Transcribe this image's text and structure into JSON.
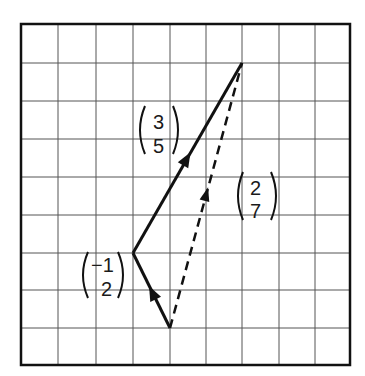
{
  "diagram": {
    "type": "vector-addition-grid",
    "grid": {
      "columns": 9,
      "rows": 9
    },
    "vectors": [
      {
        "name": "vector-a",
        "components": [
          "-1",
          "2"
        ],
        "style": "solid",
        "from": [
          4,
          1
        ],
        "to": [
          3,
          3
        ]
      },
      {
        "name": "vector-b",
        "components": [
          "3",
          "5"
        ],
        "style": "solid",
        "from": [
          3,
          3
        ],
        "to": [
          6,
          8
        ]
      },
      {
        "name": "resultant",
        "components": [
          "2",
          "7"
        ],
        "style": "dashed",
        "from": [
          4,
          1
        ],
        "to": [
          6,
          8
        ]
      }
    ],
    "labels": {
      "a_top": "−1",
      "a_bottom": "2",
      "b_top": "3",
      "b_bottom": "5",
      "r_top": "2",
      "r_bottom": "7"
    }
  }
}
